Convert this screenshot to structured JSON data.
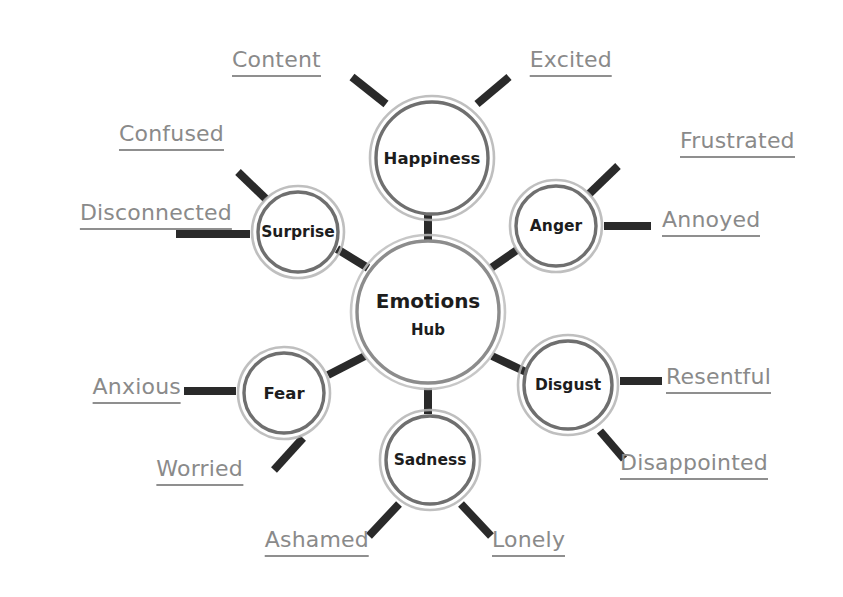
{
  "diagram": {
    "type": "mind-map",
    "background_color": "#ffffff",
    "palette": {
      "ring_outer": "#b4b4b4",
      "ring_inner": "#6f6f6f",
      "hub_ring_outer": "#bdbdbd",
      "hub_ring_inner": "#8c8c8c",
      "spoke": "#2a2a2a",
      "leaf_connector": "#2a2a2a",
      "node_text": "#1d1d1d",
      "leaf_text": "#8a8a8a",
      "leaf_underline": "#8f8f8f"
    },
    "hub": {
      "label": "Emotions",
      "sublabel": "Hub",
      "cx": 428,
      "cy": 312,
      "r": 77
    },
    "branches": [
      {
        "id": "happiness",
        "label": "Happiness",
        "cx": 432,
        "cy": 158,
        "r": 62,
        "font": "branch",
        "leaves": [
          {
            "label": "Content",
            "x": 232,
            "y": 62,
            "anchor": "left",
            "line": [
              [
                386,
                104
              ],
              [
                352,
                77
              ]
            ]
          },
          {
            "label": "Excited",
            "x": 612,
            "y": 62,
            "anchor": "right",
            "line": [
              [
                477,
                104
              ],
              [
                509,
                77
              ]
            ]
          }
        ]
      },
      {
        "id": "anger",
        "label": "Anger",
        "cx": 556,
        "cy": 226,
        "r": 46,
        "font": "branch small",
        "leaves": [
          {
            "label": "Frustrated",
            "x": 680,
            "y": 143,
            "anchor": "left",
            "line": [
              [
                589,
                194
              ],
              [
                618,
                166
              ]
            ]
          },
          {
            "label": "Annoyed",
            "x": 662,
            "y": 222,
            "anchor": "left",
            "line": [
              [
                604,
                226
              ],
              [
                651,
                226
              ]
            ]
          }
        ]
      },
      {
        "id": "surprise",
        "label": "Surprise",
        "cx": 298,
        "cy": 232,
        "r": 46,
        "font": "branch small",
        "leaves": [
          {
            "label": "Confused",
            "x": 224,
            "y": 136,
            "anchor": "right",
            "line": [
              [
                266,
                199
              ],
              [
                238,
                172
              ]
            ]
          },
          {
            "label": "Disconnected",
            "x": 232,
            "y": 215,
            "anchor": "right",
            "line": [
              [
                250,
                234
              ],
              [
                176,
                234
              ]
            ]
          }
        ]
      },
      {
        "id": "fear",
        "label": "Fear",
        "cx": 284,
        "cy": 393,
        "r": 46,
        "font": "branch",
        "leaves": [
          {
            "label": "Anxious",
            "x": 181,
            "y": 389,
            "anchor": "right",
            "line": [
              [
                236,
                391
              ],
              [
                184,
                391
              ]
            ]
          },
          {
            "label": "Worried",
            "x": 243,
            "y": 471,
            "anchor": "right",
            "line": [
              [
                303,
                438
              ],
              [
                274,
                470
              ]
            ]
          }
        ]
      },
      {
        "id": "sadness",
        "label": "Sadness",
        "cx": 430,
        "cy": 460,
        "r": 50,
        "font": "branch small",
        "leaves": [
          {
            "label": "Ashamed",
            "x": 369,
            "y": 542,
            "anchor": "right",
            "line": [
              [
                399,
                504
              ],
              [
                369,
                536
              ]
            ]
          },
          {
            "label": "Lonely",
            "x": 492,
            "y": 542,
            "anchor": "left",
            "line": [
              [
                461,
                504
              ],
              [
                491,
                536
              ]
            ]
          }
        ]
      },
      {
        "id": "disgust",
        "label": "Disgust",
        "cx": 568,
        "cy": 385,
        "r": 50,
        "font": "branch small",
        "leaves": [
          {
            "label": "Resentful",
            "x": 666,
            "y": 379,
            "anchor": "left",
            "line": [
              [
                620,
                381
              ],
              [
                662,
                381
              ]
            ]
          },
          {
            "label": "Disappointed",
            "x": 620,
            "y": 465,
            "anchor": "left",
            "line": [
              [
                600,
                431
              ],
              [
                624,
                459
              ]
            ]
          }
        ]
      }
    ],
    "hub_spokes": [
      {
        "to": "happiness",
        "line": [
          [
            428,
            240
          ],
          [
            428,
            214
          ]
        ]
      },
      {
        "to": "anger",
        "line": [
          [
            491,
            268
          ],
          [
            517,
            250
          ]
        ]
      },
      {
        "to": "surprise",
        "line": [
          [
            368,
            268
          ],
          [
            337,
            249
          ]
        ]
      },
      {
        "to": "fear",
        "line": [
          [
            365,
            356
          ],
          [
            328,
            375
          ]
        ]
      },
      {
        "to": "sadness",
        "line": [
          [
            428,
            388
          ],
          [
            428,
            414
          ]
        ]
      },
      {
        "to": "disgust",
        "line": [
          [
            492,
            356
          ],
          [
            526,
            372
          ]
        ]
      }
    ]
  }
}
